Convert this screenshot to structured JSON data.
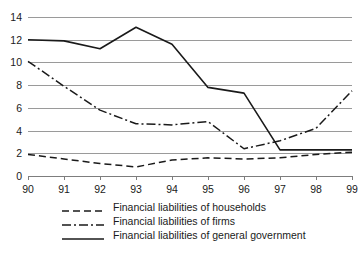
{
  "chart_data": {
    "type": "line",
    "title": "",
    "xlabel": "",
    "ylabel": "",
    "x": [
      "90",
      "91",
      "92",
      "93",
      "94",
      "95",
      "96",
      "97",
      "98",
      "99"
    ],
    "categories": [
      "90",
      "91",
      "92",
      "93",
      "94",
      "95",
      "96",
      "97",
      "98",
      "99"
    ],
    "xlim": [
      0,
      9
    ],
    "ylim": [
      0,
      14
    ],
    "yticks": [
      "0",
      "2",
      "4",
      "6",
      "8",
      "10",
      "12",
      "14"
    ],
    "ytick_values": [
      0,
      2,
      4,
      6,
      8,
      10,
      12,
      14
    ],
    "grid": "horizontal",
    "grid_color": "#9a9a9a",
    "legend_position": "below",
    "series": [
      {
        "name": "Financial liabilities of households",
        "style": "dashed",
        "color": "#1a1a1a",
        "values": [
          1.9,
          1.5,
          1.1,
          0.8,
          1.4,
          1.6,
          1.5,
          1.6,
          1.9,
          2.1
        ]
      },
      {
        "name": "Financial liabilities of firms",
        "style": "dash-dot",
        "color": "#1a1a1a",
        "values": [
          10.1,
          7.9,
          5.8,
          4.6,
          4.5,
          4.8,
          2.4,
          3.1,
          4.2,
          7.5
        ]
      },
      {
        "name": "Financial liabilities of general government",
        "style": "solid",
        "color": "#1a1a1a",
        "values": [
          12.0,
          11.9,
          11.2,
          13.1,
          11.6,
          7.8,
          7.3,
          2.3,
          2.3,
          2.3
        ]
      }
    ]
  },
  "legend": {
    "items": [
      {
        "label": "Financial liabilities of households",
        "style": "dashed"
      },
      {
        "label": "Financial liabilities of firms",
        "style": "dash-dot"
      },
      {
        "label": "Financial liabilities of general government",
        "style": "solid"
      }
    ]
  }
}
